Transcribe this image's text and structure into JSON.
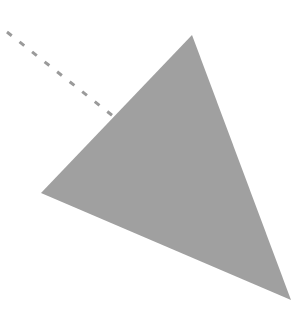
{
  "canvas": {
    "width": 308,
    "height": 317,
    "background": "#ffffff"
  },
  "shapes": {
    "triangle": {
      "points": "192,35 41,193 291,300",
      "fill": "#a0a0a0"
    },
    "dashed_line": {
      "x1": 7,
      "y1": 32,
      "x2": 118,
      "y2": 120,
      "stroke": "#9a9a9a",
      "stroke_width": 3,
      "dasharray": "6,10"
    }
  }
}
